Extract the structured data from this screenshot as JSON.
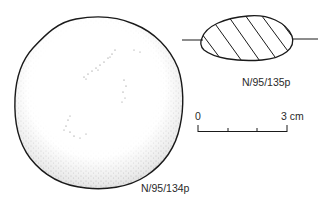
{
  "figure": {
    "artifact_plan": {
      "label": "N/95/134p",
      "fill": "stippled",
      "outline_color": "#1a1a1a"
    },
    "artifact_section": {
      "label": "N/95/135p",
      "fill": "diagonal-hatching",
      "outline_color": "#1a1a1a"
    },
    "scale_bar": {
      "start_label": "0",
      "end_label": "3 cm",
      "divisions": 3
    }
  }
}
